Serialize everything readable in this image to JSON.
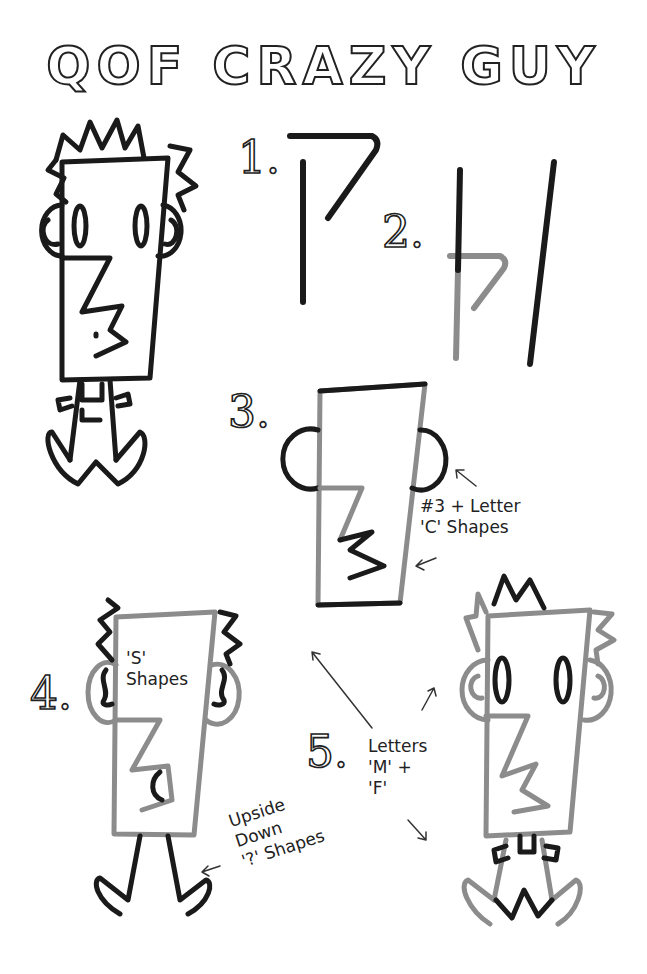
{
  "title": "QOF CRAZY GUY",
  "steps": [
    {
      "number": "1.",
      "description": "Vertical line and 7 shape"
    },
    {
      "number": "2.",
      "description": "Add vertical line on right"
    },
    {
      "number": "3.",
      "description": "Add 3 nose and ears",
      "label": "#3 + Letter\n'C' Shapes"
    },
    {
      "number": "4.",
      "description": "Add hair, ear swirls, legs",
      "label_inside": "'S'\nShapes",
      "label_legs": "Upside\nDown\n'?' Shapes"
    },
    {
      "number": "5.",
      "description": "Add hair, eyes, collar, shoes",
      "label": "Letters\n'M' +\n'F'"
    }
  ],
  "colors": {
    "dark_line": "#1a1a1a",
    "gray_line": "#8c8c8c",
    "background": "#ffffff"
  }
}
